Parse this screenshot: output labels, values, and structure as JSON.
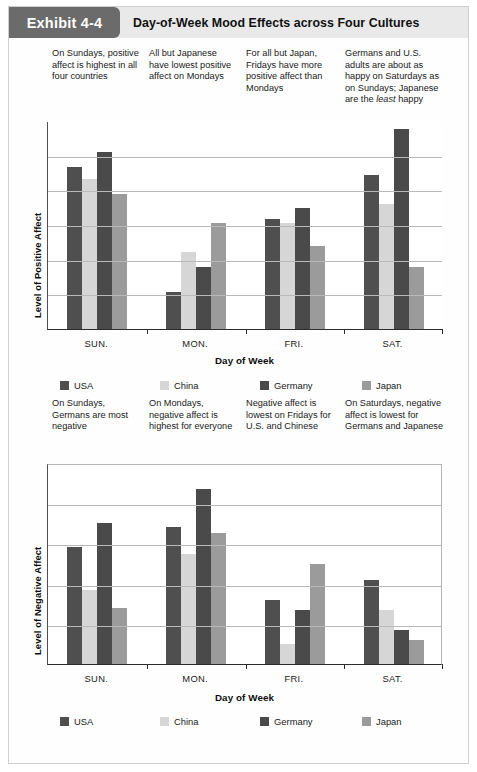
{
  "header": {
    "exhibit_tag": "Exhibit 4-4",
    "title": "Day-of-Week Mood Effects across Four Cultures"
  },
  "annotations_top": [
    "On Sundays, positive affect is highest in all four countries",
    "All but Japanese have lowest positive affect on Mondays",
    "For all but Japan, Fridays have more positive affect than Mondays",
    "Germans and U.S. adults are about as happy on Saturdays as on Sundays; Japanese are the least happy"
  ],
  "annotations_middle": [
    "On Sundays, Germans are most negative",
    "On Mondays, negative affect is highest for everyone",
    "Negative affect is lowest on Fridays for U.S. and Chinese",
    "On Saturdays, negative affect is lowest for Germans and Japanese"
  ],
  "legend": {
    "items": [
      {
        "label": "USA",
        "color": "#4f4f4f",
        "key": "usa"
      },
      {
        "label": "China",
        "color": "#d6d6d6",
        "key": "china"
      },
      {
        "label": "Germany",
        "color": "#4a4a4a",
        "key": "germany"
      },
      {
        "label": "Japan",
        "color": "#9b9b9b",
        "key": "japan"
      }
    ]
  },
  "chart_data": [
    {
      "type": "bar",
      "title": "Day-of-Week Mood Effects across Four Cultures",
      "subtitle": "Positive Affect",
      "xlabel": "Day of Week",
      "ylabel": "Level of Positive Affect",
      "categories": [
        "SUN.",
        "MON.",
        "FRI.",
        "SAT."
      ],
      "ylim": [
        0,
        100
      ],
      "yticks_unlabeled": true,
      "gridlines": 5,
      "legend_position": "bottom",
      "series": [
        {
          "name": "USA",
          "color": "#4f4f4f",
          "values": [
            78,
            18,
            53,
            74
          ]
        },
        {
          "name": "China",
          "color": "#d6d6d6",
          "values": [
            72,
            37,
            51,
            60
          ]
        },
        {
          "name": "Germany",
          "color": "#4a4a4a",
          "values": [
            85,
            30,
            58,
            96
          ]
        },
        {
          "name": "Japan",
          "color": "#9b9b9b",
          "values": [
            65,
            51,
            40,
            30
          ]
        }
      ]
    },
    {
      "type": "bar",
      "title": "Day-of-Week Mood Effects across Four Cultures",
      "subtitle": "Negative Affect",
      "xlabel": "Day of Week",
      "ylabel": "Level of Negative Affect",
      "categories": [
        "SUN.",
        "MON.",
        "FRI.",
        "SAT."
      ],
      "ylim": [
        0,
        100
      ],
      "yticks_unlabeled": true,
      "gridlines": 4,
      "legend_position": "bottom",
      "series": [
        {
          "name": "USA",
          "color": "#4f4f4f",
          "values": [
            58,
            68,
            32,
            42
          ]
        },
        {
          "name": "China",
          "color": "#d6d6d6",
          "values": [
            37,
            55,
            10,
            27
          ]
        },
        {
          "name": "Germany",
          "color": "#4a4a4a",
          "values": [
            70,
            87,
            27,
            17
          ]
        },
        {
          "name": "Japan",
          "color": "#9b9b9b",
          "values": [
            28,
            65,
            50,
            12
          ]
        }
      ]
    }
  ]
}
